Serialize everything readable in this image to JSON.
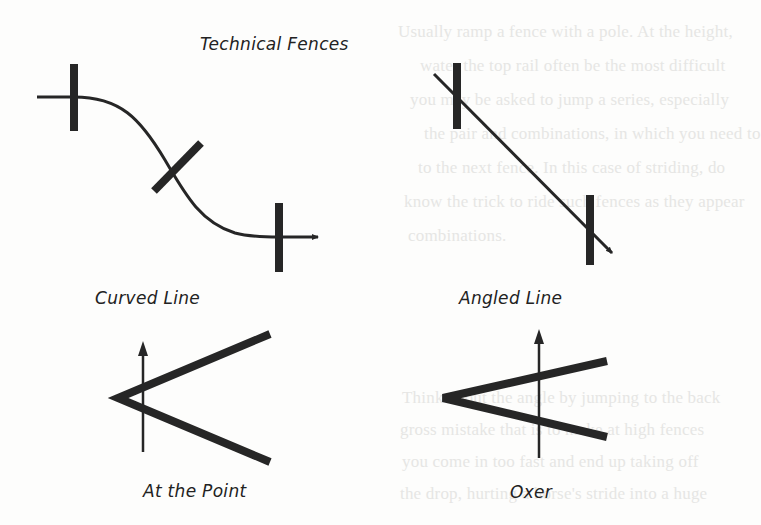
{
  "title": "Technical Fences",
  "figures": [
    {
      "id": "curved-line",
      "label": "Curved Line"
    },
    {
      "id": "angled-line",
      "label": "Angled Line"
    },
    {
      "id": "at-the-point",
      "label": "At the Point"
    },
    {
      "id": "oxer",
      "label": "Oxer"
    }
  ],
  "colors": {
    "ink": "#262626",
    "background": "#fdfdfc",
    "show_through": "#e6e6e4"
  },
  "show_through_text": [
    "Usually ramp a fence with a pole. At the height,",
    "water the top rail often be the most difficult",
    "you may be asked to jump a series, especially",
    "the pair and combinations, in which you need to",
    "to the next fence. In this case of striding, do",
    "know the trick to ride such fences as they appear",
    "combinations.",
    "Think about the angle by jumping to the back",
    "gross mistake that is to make at high fences",
    "you come in too fast and end up taking off",
    "the drop, hurting a horse's stride into a huge"
  ]
}
